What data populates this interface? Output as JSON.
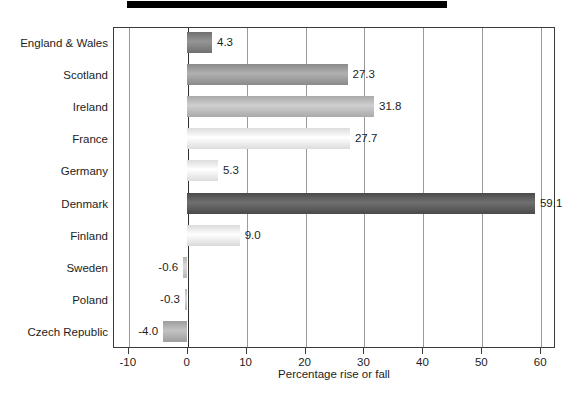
{
  "chart_data": {
    "type": "bar",
    "orientation": "horizontal",
    "title": "",
    "xlabel": "Percentage rise or fall",
    "ylabel": "",
    "xlim": [
      -12.5,
      62.5
    ],
    "xticks": [
      -10,
      0,
      10,
      20,
      30,
      40,
      50,
      60
    ],
    "xtick_labels": [
      "-10",
      "0",
      "10",
      "20",
      "30",
      "40",
      "50",
      "60"
    ],
    "grid": true,
    "grid_axis": "x",
    "legend": false,
    "categories": [
      "England & Wales",
      "Scotland",
      "Ireland",
      "France",
      "Germany",
      "Denmark",
      "Finland",
      "Sweden",
      "Poland",
      "Czech Republic"
    ],
    "values": [
      4.3,
      27.3,
      31.8,
      27.7,
      5.3,
      59.1,
      9.0,
      -0.6,
      -0.3,
      -4.0
    ],
    "value_labels": [
      "4.3",
      "27.3",
      "31.8",
      "27.7",
      "5.3",
      "59.1",
      "9.0",
      "-0.6",
      "-0.3",
      "-4.0"
    ],
    "bar_colors": [
      "#6f6f6f",
      "#8a8a8a",
      "#a9a9a9",
      "#dcdcdc",
      "#dcdcdc",
      "#4a4a4a",
      "#dadada",
      "#b5b5b5",
      "#b5b5b5",
      "#9d9d9d"
    ]
  },
  "axis": {
    "x_title": "Percentage rise or fall"
  }
}
